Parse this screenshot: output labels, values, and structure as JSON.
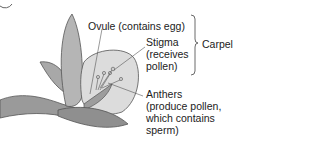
{
  "diagram": {
    "labels": {
      "ovule": "Ovule (contains egg)",
      "stigma_line1": "Stigma",
      "stigma_line2": "(receives",
      "stigma_line3": "pollen)",
      "carpel": "Carpel",
      "anthers_line1": "Anthers",
      "anthers_line2": "(produce pollen,",
      "anthers_line3": "which contains",
      "anthers_line4": "sperm)"
    },
    "colors": {
      "text": "#222222",
      "line": "#555555",
      "petal": "#bdbdbd",
      "petal_dark": "#7a7a7a"
    }
  }
}
